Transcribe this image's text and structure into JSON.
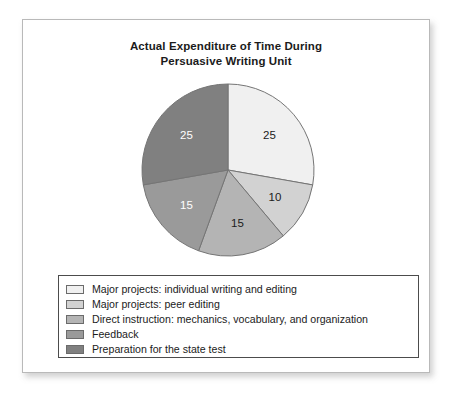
{
  "chart_data": {
    "type": "pie",
    "title": "Actual Expenditure of Time During Persuasive Writing Unit",
    "title_lines": [
      "Actual Expenditure of Time During",
      "Persuasive Writing Unit"
    ],
    "categories": [
      "Major projects: individual writing and editing",
      "Major projects: peer editing",
      "Direct instruction: mechanics, vocabulary, and organization",
      "Feedback",
      "Preparation for the state test"
    ],
    "values": [
      25,
      10,
      15,
      15,
      25
    ],
    "value_labels": [
      "25",
      "10",
      "15",
      "15",
      "25"
    ],
    "colors": [
      "#f0f0f0",
      "#d2d2d2",
      "#b4b4b4",
      "#9a9a9a",
      "#808080"
    ],
    "label_colors": [
      "#1b1b1b",
      "#1b1b1b",
      "#1b1b1b",
      "#ffffff",
      "#ffffff"
    ],
    "slice_order": "clockwise from 12 o'clock",
    "total": 90,
    "legend_position": "bottom",
    "xlabel": "",
    "ylabel": ""
  },
  "legend": {
    "items": [
      {
        "label": "Major projects: individual writing and editing",
        "color": "#f0f0f0"
      },
      {
        "label": "Major projects: peer editing",
        "color": "#d2d2d2"
      },
      {
        "label": "Direct instruction: mechanics, vocabulary, and organization",
        "color": "#b4b4b4"
      },
      {
        "label": "Feedback",
        "color": "#9a9a9a"
      },
      {
        "label": "Preparation for the state test",
        "color": "#808080"
      }
    ]
  }
}
